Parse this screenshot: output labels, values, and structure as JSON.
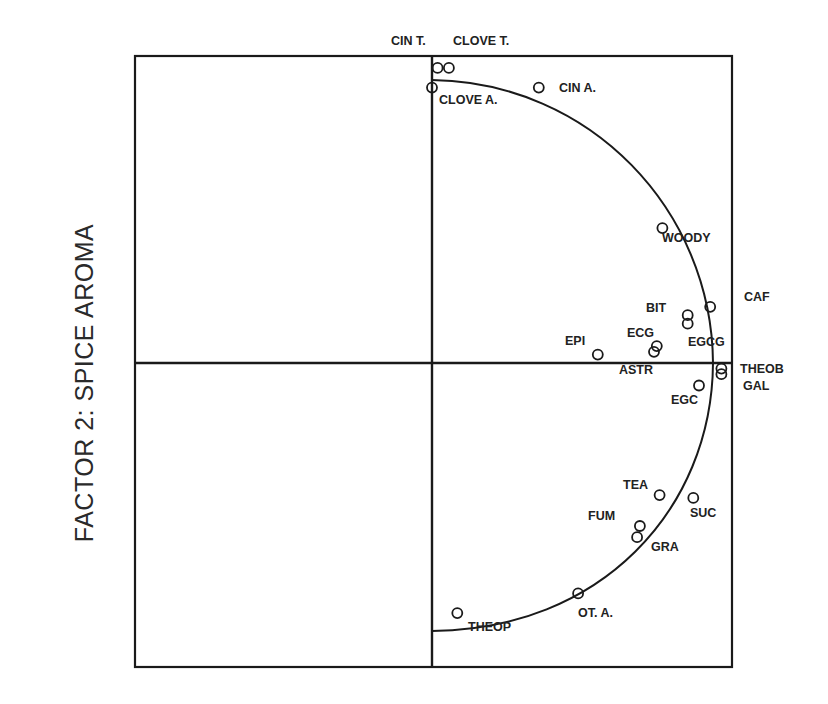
{
  "chart_data": {
    "type": "scatter",
    "title": "",
    "xlabel": "",
    "ylabel": "FACTOR 2:  SPICE AROMA",
    "xlim": [
      -1.06,
      1.06
    ],
    "ylim": [
      -1.09,
      1.09
    ],
    "grid": false,
    "reference_lines": {
      "x0": true,
      "y0": true
    },
    "unit_semicircle": true,
    "top_labels": [
      "CIN T.",
      "CLOVE T."
    ],
    "points": [
      {
        "label": "CIN T.",
        "x": 0.02,
        "y": 1.05,
        "label_pos": "top"
      },
      {
        "label": "CLOVE T.",
        "x": 0.06,
        "y": 1.05,
        "label_pos": "top"
      },
      {
        "label": "CLOVE A.",
        "x": 0.0,
        "y": 0.98,
        "label_pos": "below-right"
      },
      {
        "label": "CIN A.",
        "x": 0.38,
        "y": 0.98,
        "label_pos": "right"
      },
      {
        "label": "WOODY",
        "x": 0.82,
        "y": 0.48,
        "label_pos": "below-right"
      },
      {
        "label": "CAF",
        "x": 0.99,
        "y": 0.2,
        "label_pos": "far-right"
      },
      {
        "label": "BIT",
        "x": 0.91,
        "y": 0.17,
        "label_pos": "left"
      },
      {
        "label": "EGCG",
        "x": 0.91,
        "y": 0.14,
        "label_pos": "below"
      },
      {
        "label": "EPI",
        "x": 0.59,
        "y": 0.03,
        "label_pos": "upper-left"
      },
      {
        "label": "ECG",
        "x": 0.8,
        "y": 0.06,
        "label_pos": "upper-left"
      },
      {
        "label": "ASTR",
        "x": 0.79,
        "y": 0.04,
        "label_pos": "below-left"
      },
      {
        "label": "THEOB",
        "x": 1.03,
        "y": -0.02,
        "label_pos": "far-right"
      },
      {
        "label": "GAL",
        "x": 1.03,
        "y": -0.04,
        "label_pos": "far-right"
      },
      {
        "label": "EGC",
        "x": 0.95,
        "y": -0.08,
        "label_pos": "below-left"
      },
      {
        "label": "TEA",
        "x": 0.81,
        "y": -0.47,
        "label_pos": "upper-left"
      },
      {
        "label": "SUC",
        "x": 0.93,
        "y": -0.48,
        "label_pos": "below-right"
      },
      {
        "label": "FUM",
        "x": 0.74,
        "y": -0.58,
        "label_pos": "left"
      },
      {
        "label": "GRA",
        "x": 0.73,
        "y": -0.62,
        "label_pos": "below-right"
      },
      {
        "label": "OT. A.",
        "x": 0.52,
        "y": -0.82,
        "label_pos": "below"
      },
      {
        "label": "THEOP",
        "x": 0.09,
        "y": -0.89,
        "label_pos": "below-right"
      }
    ]
  },
  "labels": {
    "y_axis": "FACTOR 2:  SPICE AROMA",
    "cin_t": "CIN T.",
    "clove_t": "CLOVE T.",
    "clove_a": "CLOVE A.",
    "cin_a": "CIN A.",
    "woody": "WOODY",
    "caf": "CAF",
    "bit": "BIT",
    "egcg": "EGCG",
    "epi": "EPI",
    "ecg": "ECG",
    "astr": "ASTR",
    "theob": "THEOB",
    "gal": "GAL",
    "egc": "EGC",
    "tea": "TEA",
    "suc": "SUC",
    "fum": "FUM",
    "gra": "GRA",
    "ot_a": "OT. A.",
    "theop": "THEOP"
  }
}
